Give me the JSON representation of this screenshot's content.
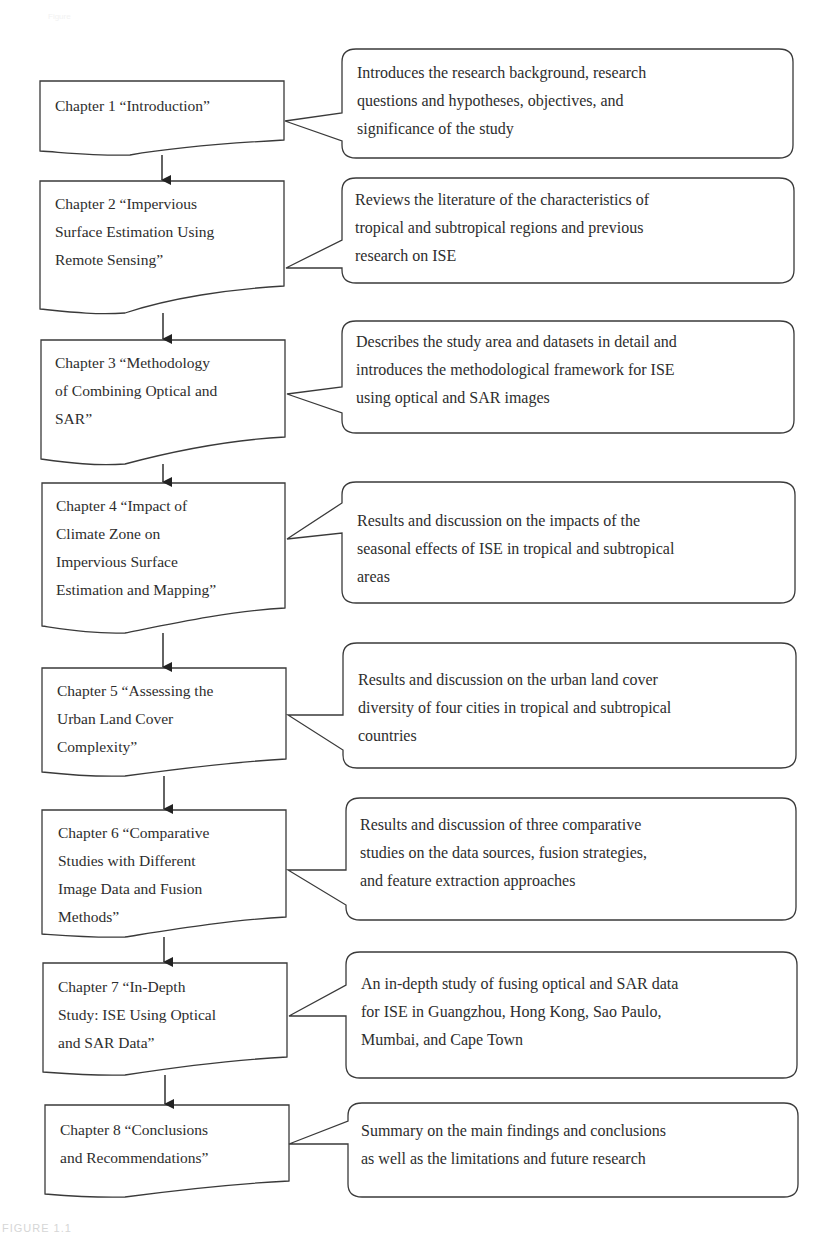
{
  "header": {
    "faint_label": "Figure"
  },
  "caption": "FIGURE 1.1",
  "colors": {
    "stroke": "#3a3a3a",
    "text": "#2d2d2d",
    "background": "#ffffff"
  },
  "chapters": [
    {
      "number": 1,
      "lines": [
        "Chapter 1 “Introduction”"
      ],
      "description": [
        "Introduces the research background, research",
        "questions and hypotheses, objectives, and",
        "significance of the study"
      ]
    },
    {
      "number": 2,
      "lines": [
        "Chapter 2 “Impervious",
        "Surface Estimation Using",
        "Remote Sensing”"
      ],
      "description": [
        "Reviews the literature of the characteristics of",
        "tropical and subtropical regions and previous",
        "research on ISE"
      ]
    },
    {
      "number": 3,
      "lines": [
        "Chapter 3 “Methodology",
        "of Combining Optical and",
        "SAR”"
      ],
      "description": [
        "Describes the study area and datasets in detail and",
        "introduces the methodological framework for ISE",
        "using optical and SAR images"
      ]
    },
    {
      "number": 4,
      "lines": [
        "Chapter 4 “Impact of",
        "Climate Zone on",
        "Impervious Surface",
        "Estimation and Mapping”"
      ],
      "description": [
        "Results and discussion on the impacts of the",
        "seasonal effects of ISE in tropical and subtropical",
        "areas"
      ]
    },
    {
      "number": 5,
      "lines": [
        "Chapter 5 “Assessing the",
        "Urban Land Cover",
        "Complexity”"
      ],
      "description": [
        "Results and discussion on the urban land cover",
        "diversity of four cities in tropical and subtropical",
        "countries"
      ]
    },
    {
      "number": 6,
      "lines": [
        "Chapter 6 “Comparative",
        "Studies with Different",
        "Image Data and Fusion",
        "Methods”"
      ],
      "description": [
        "Results and discussion of three comparative",
        "studies on the data sources, fusion strategies,",
        "and feature extraction approaches"
      ]
    },
    {
      "number": 7,
      "lines": [
        "Chapter 7 “In-Depth",
        "Study: ISE Using Optical",
        "and SAR Data”"
      ],
      "description": [
        "An in-depth study of fusing optical and SAR data",
        "for ISE in Guangzhou, Hong Kong, Sao Paulo,",
        "Mumbai, and Cape Town"
      ]
    },
    {
      "number": 8,
      "lines": [
        "Chapter 8 “Conclusions",
        "and Recommendations”"
      ],
      "description": [
        "Summary on the main findings and conclusions",
        "as well as the limitations and future research"
      ]
    }
  ]
}
